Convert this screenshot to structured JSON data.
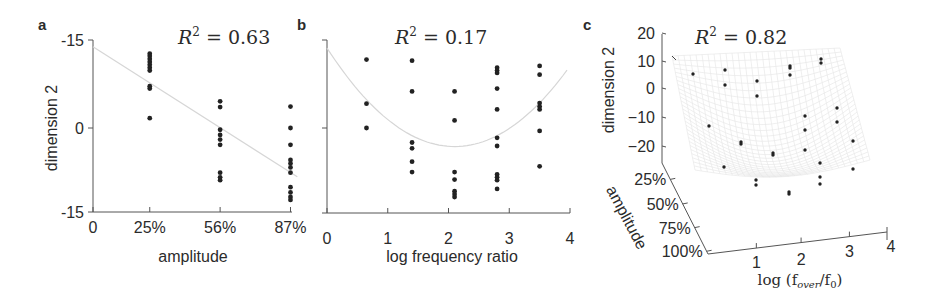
{
  "chart_data": [
    {
      "panel": "a",
      "type": "scatter",
      "title": "R² = 0.63",
      "r2_label": {
        "base": "R",
        "sup": "2",
        "rest": " = 0.63"
      },
      "xlabel": "amplitude",
      "ylabel": "dimension 2",
      "xticks": [
        {
          "v": 0,
          "label": "0"
        },
        {
          "v": 25,
          "label": "25%"
        },
        {
          "v": 56,
          "label": "56%"
        },
        {
          "v": 87,
          "label": "87%"
        }
      ],
      "yticks": [
        {
          "v": 15,
          "label": "-15"
        },
        {
          "v": 0,
          "label": "0"
        },
        {
          "v": -15,
          "label": "-15"
        }
      ],
      "xlim": [
        0,
        90
      ],
      "ylim": [
        -15,
        15
      ],
      "grid": false,
      "fit": {
        "type": "linear",
        "x": [
          0,
          90
        ],
        "y": [
          14,
          -8.4
        ]
      },
      "points": [
        {
          "x": 25,
          "y": [
            12.8,
            12.4,
            11.9,
            11.4,
            10.9,
            10.4,
            9.9,
            7.2,
            6.8,
            1.7
          ]
        },
        {
          "x": 56,
          "y": [
            4.6,
            3.6,
            -0.3,
            -1.2,
            -2.0,
            -2.9,
            -7.7,
            -8.5,
            -9.0
          ]
        },
        {
          "x": 87,
          "y": [
            3.7,
            0,
            -2.9,
            -5.5,
            -6.1,
            -6.8,
            -7.7,
            -10.2,
            -11.1,
            -11.9,
            -12.4
          ]
        }
      ]
    },
    {
      "panel": "b",
      "type": "scatter",
      "title": "R² = 0.17",
      "r2_label": {
        "base": "R",
        "sup": "2",
        "rest": " = 0.17"
      },
      "xlabel": "log frequency ratio",
      "ylabel": "",
      "xticks": [
        {
          "v": 0,
          "label": "0"
        },
        {
          "v": 1,
          "label": "1"
        },
        {
          "v": 2,
          "label": "2"
        },
        {
          "v": 3,
          "label": "3"
        },
        {
          "v": 4,
          "label": "4"
        }
      ],
      "yticks": [
        {
          "v": 15,
          "label": ""
        },
        {
          "v": 0,
          "label": ""
        },
        {
          "v": -15,
          "label": ""
        }
      ],
      "xlim": [
        0,
        4
      ],
      "ylim": [
        -15,
        15
      ],
      "grid": false,
      "fit": {
        "type": "quadratic",
        "vertex_x": 2.1,
        "vertex_y": -3.2,
        "a": 3.85,
        "x_range": [
          0,
          3.95
        ]
      },
      "points": [
        {
          "x": 0.65,
          "y": [
            11.8,
            4.2,
            0
          ]
        },
        {
          "x": 1.4,
          "y": [
            11.6,
            6.3,
            -2.5,
            -3.5,
            -5.8,
            -7.6
          ]
        },
        {
          "x": 2.1,
          "y": [
            6.3,
            1.3,
            -7.6,
            -8.9,
            -10.9,
            -11.4,
            -11.9
          ]
        },
        {
          "x": 2.8,
          "y": [
            10.4,
            9.9,
            9.5,
            6.8,
            3.2,
            -1.7,
            -3.1,
            -8.0,
            -8.5,
            -9.0,
            -10.5
          ]
        },
        {
          "x": 3.5,
          "y": [
            10.7,
            9.2,
            4.3,
            3.7,
            3.2,
            -0.5,
            -6.6
          ]
        }
      ]
    },
    {
      "panel": "c",
      "type": "scatter3d",
      "title": "R² = 0.82",
      "r2_label": {
        "base": "R",
        "sup": "2",
        "rest": " = 0.82"
      },
      "zlabel": "dimension 2",
      "ylabel": "amplitude",
      "xlabel": {
        "pre": "log (f",
        "sub1": "over",
        "mid": "/f",
        "sub2": "0",
        "post": ")"
      },
      "zticks": [
        "20",
        "10",
        "0",
        "−10",
        "−20"
      ],
      "yticks": [
        "25%",
        "50%",
        "75%",
        "100%"
      ],
      "xticks": [
        "1",
        "2",
        "3",
        "4"
      ],
      "surface": "fitted quadratic mesh (light grey)",
      "points_projected_count": 30
    }
  ],
  "panel_labels": [
    "a",
    "b",
    "c"
  ]
}
